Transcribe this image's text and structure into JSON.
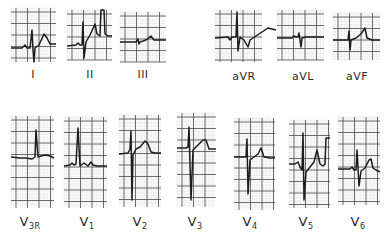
{
  "figure": {
    "colors": {
      "grid_major": "#4a4a4a",
      "grid_minor": "#b9b9b9",
      "trace": "#1c1c1c",
      "background": "#ffffff"
    }
  },
  "leads": [
    {
      "id": "I",
      "label": "I",
      "sub": "",
      "box": [
        11,
        8,
        45,
        54
      ],
      "label_pos": [
        33,
        68
      ],
      "trace": [
        [
          11,
          48
        ],
        [
          22,
          48
        ],
        [
          25,
          45
        ],
        [
          27,
          48
        ],
        [
          30,
          48
        ],
        [
          32,
          30
        ],
        [
          33,
          50
        ],
        [
          34,
          62
        ],
        [
          35,
          48
        ],
        [
          39,
          45
        ],
        [
          44,
          34
        ],
        [
          47,
          38
        ],
        [
          50,
          44
        ],
        [
          56,
          44
        ]
      ]
    },
    {
      "id": "II",
      "label": "II",
      "sub": "",
      "box": [
        67,
        10,
        45,
        50
      ],
      "label_pos": [
        90,
        68
      ],
      "trace": [
        [
          67,
          46
        ],
        [
          76,
          45
        ],
        [
          78,
          43
        ],
        [
          80,
          45
        ],
        [
          82,
          45
        ],
        [
          83,
          22
        ],
        [
          84,
          58
        ],
        [
          86,
          42
        ],
        [
          90,
          35
        ],
        [
          95,
          24
        ],
        [
          97,
          34
        ],
        [
          100,
          36
        ],
        [
          101,
          10
        ],
        [
          104,
          10
        ],
        [
          105,
          34
        ],
        [
          108,
          36
        ],
        [
          112,
          36
        ]
      ]
    },
    {
      "id": "III",
      "label": "III",
      "sub": "",
      "box": [
        120,
        12,
        46,
        50
      ],
      "label_pos": [
        143,
        68
      ],
      "trace": [
        [
          120,
          42
        ],
        [
          136,
          42
        ],
        [
          138,
          39
        ],
        [
          139,
          44
        ],
        [
          140,
          42
        ],
        [
          146,
          40
        ],
        [
          151,
          36
        ],
        [
          154,
          40
        ],
        [
          158,
          40
        ],
        [
          166,
          40
        ]
      ]
    },
    {
      "id": "aVR",
      "label": "aVR",
      "sub": "",
      "box": [
        215,
        10,
        47,
        52
      ],
      "label_pos": [
        244,
        70
      ],
      "trace": [
        [
          215,
          38
        ],
        [
          228,
          37
        ],
        [
          230,
          40
        ],
        [
          232,
          37
        ],
        [
          236,
          37
        ],
        [
          237,
          12
        ],
        [
          238,
          51
        ],
        [
          240,
          37
        ],
        [
          244,
          40
        ],
        [
          248,
          47
        ],
        [
          250,
          40
        ],
        [
          256,
          36
        ],
        [
          262,
          32
        ],
        [
          268,
          28
        ],
        [
          276,
          30
        ]
      ]
    },
    {
      "id": "aVL",
      "label": "aVL",
      "sub": "",
      "box": [
        277,
        10,
        47,
        50
      ],
      "label_pos": [
        303,
        70
      ],
      "trace": [
        [
          277,
          38
        ],
        [
          292,
          38
        ],
        [
          294,
          36
        ],
        [
          296,
          37
        ],
        [
          298,
          37
        ],
        [
          299,
          33
        ],
        [
          301,
          47
        ],
        [
          302,
          38
        ],
        [
          306,
          37
        ],
        [
          312,
          37
        ],
        [
          324,
          37
        ]
      ]
    },
    {
      "id": "aVF",
      "label": "aVF",
      "sub": "",
      "box": [
        333,
        13,
        47,
        47
      ],
      "label_pos": [
        357,
        70
      ],
      "trace": [
        [
          333,
          40
        ],
        [
          346,
          40
        ],
        [
          348,
          40
        ],
        [
          349,
          31
        ],
        [
          350,
          50
        ],
        [
          351,
          40
        ],
        [
          356,
          38
        ],
        [
          361,
          34
        ],
        [
          365,
          28
        ],
        [
          367,
          38
        ],
        [
          372,
          40
        ],
        [
          380,
          40
        ]
      ]
    },
    {
      "id": "V3R",
      "label": "V",
      "sub": "3R",
      "box": [
        11,
        116,
        43,
        92
      ],
      "label_pos": [
        30,
        214
      ],
      "trace": [
        [
          11,
          157
        ],
        [
          20,
          158
        ],
        [
          26,
          158
        ],
        [
          32,
          159
        ],
        [
          35,
          157
        ],
        [
          36,
          130
        ],
        [
          38,
          157
        ],
        [
          41,
          156
        ],
        [
          46,
          155
        ],
        [
          50,
          156
        ],
        [
          54,
          158
        ]
      ]
    },
    {
      "id": "V1",
      "label": "V",
      "sub": "1",
      "box": [
        64,
        117,
        43,
        91
      ],
      "label_pos": [
        87,
        214
      ],
      "trace": [
        [
          64,
          166
        ],
        [
          70,
          165
        ],
        [
          72,
          163
        ],
        [
          74,
          165
        ],
        [
          76,
          164
        ],
        [
          78,
          128
        ],
        [
          80,
          166
        ],
        [
          84,
          163
        ],
        [
          88,
          166
        ],
        [
          91,
          162
        ],
        [
          93,
          165
        ],
        [
          97,
          166
        ],
        [
          107,
          166
        ]
      ]
    },
    {
      "id": "V2",
      "label": "V",
      "sub": "2",
      "box": [
        119,
        115,
        42,
        92
      ],
      "label_pos": [
        140,
        214
      ],
      "trace": [
        [
          119,
          154
        ],
        [
          128,
          153
        ],
        [
          130,
          149
        ],
        [
          131,
          131
        ],
        [
          132,
          200
        ],
        [
          133,
          155
        ],
        [
          136,
          149
        ],
        [
          140,
          147
        ],
        [
          145,
          141
        ],
        [
          148,
          144
        ],
        [
          151,
          152
        ],
        [
          155,
          153
        ],
        [
          161,
          153
        ]
      ]
    },
    {
      "id": "V3",
      "label": "V",
      "sub": "3",
      "box": [
        177,
        113,
        39,
        94
      ],
      "label_pos": [
        195,
        214
      ],
      "trace": [
        [
          177,
          148
        ],
        [
          186,
          148
        ],
        [
          188,
          147
        ],
        [
          189,
          127
        ],
        [
          191,
          200
        ],
        [
          193,
          150
        ],
        [
          197,
          146
        ],
        [
          203,
          140
        ],
        [
          206,
          140
        ],
        [
          209,
          149
        ],
        [
          216,
          149
        ]
      ]
    },
    {
      "id": "V4",
      "label": "V",
      "sub": "4",
      "box": [
        234,
        118,
        41,
        92
      ],
      "label_pos": [
        250,
        214
      ],
      "trace": [
        [
          234,
          157
        ],
        [
          242,
          157
        ],
        [
          246,
          157
        ],
        [
          247,
          139
        ],
        [
          248,
          194
        ],
        [
          250,
          160
        ],
        [
          254,
          157
        ],
        [
          258,
          154
        ],
        [
          261,
          148
        ],
        [
          264,
          157
        ],
        [
          270,
          158
        ],
        [
          275,
          158
        ]
      ]
    },
    {
      "id": "V5",
      "label": "V",
      "sub": "5",
      "box": [
        289,
        120,
        41,
        88
      ],
      "label_pos": [
        306,
        214
      ],
      "trace": [
        [
          289,
          164
        ],
        [
          295,
          164
        ],
        [
          298,
          162
        ],
        [
          300,
          167
        ],
        [
          302,
          170
        ],
        [
          303,
          133
        ],
        [
          304,
          200
        ],
        [
          306,
          172
        ],
        [
          310,
          167
        ],
        [
          314,
          162
        ],
        [
          317,
          150
        ],
        [
          320,
          164
        ],
        [
          323,
          166
        ],
        [
          325,
          164
        ],
        [
          326,
          138
        ],
        [
          330,
          138
        ]
      ]
    },
    {
      "id": "V6",
      "label": "V",
      "sub": "6",
      "box": [
        338,
        117,
        42,
        88
      ],
      "label_pos": [
        358,
        214
      ],
      "trace": [
        [
          338,
          169
        ],
        [
          350,
          169
        ],
        [
          352,
          167
        ],
        [
          354,
          170
        ],
        [
          356,
          170
        ],
        [
          357,
          150
        ],
        [
          359,
          186
        ],
        [
          361,
          171
        ],
        [
          365,
          168
        ],
        [
          369,
          160
        ],
        [
          371,
          159
        ],
        [
          373,
          168
        ],
        [
          376,
          170
        ],
        [
          380,
          172
        ]
      ]
    }
  ]
}
